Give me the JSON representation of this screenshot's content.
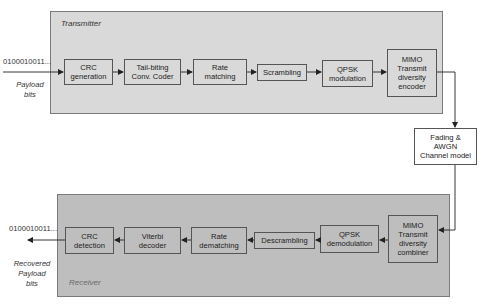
{
  "transmitter": {
    "label": "Transmitter",
    "blocks": [
      {
        "id": "crc_gen",
        "label": "CRC\ngeneration"
      },
      {
        "id": "conv_coder",
        "label": "Tail-biting\nConv. Coder"
      },
      {
        "id": "rate_match",
        "label": "Rate\nmatching"
      },
      {
        "id": "scrambling",
        "label": "Scrambling"
      },
      {
        "id": "qpsk_mod",
        "label": "QPSK\nmodulation"
      },
      {
        "id": "mimo_enc",
        "label": "MIMO\nTransmit\ndiversity\nencoder"
      }
    ],
    "input_bits": "0100010011...",
    "input_caption": "Payload\nbits"
  },
  "channel": {
    "label": "Fading &\nAWGN\nChannel model"
  },
  "receiver": {
    "label": "Receiver",
    "blocks": [
      {
        "id": "crc_det",
        "label": "CRC\ndetection"
      },
      {
        "id": "viterbi",
        "label": "Viterbi\ndecoder"
      },
      {
        "id": "rate_dematch",
        "label": "Rate\ndematching"
      },
      {
        "id": "descrambling",
        "label": "Descrambling"
      },
      {
        "id": "qpsk_demod",
        "label": "QPSK\ndemodulation"
      },
      {
        "id": "mimo_comb",
        "label": "MIMO\nTransmit\ndiversity\ncombiner"
      }
    ],
    "output_bits": "0100010011...",
    "output_caption": "Recovered\nPayload\nbits"
  },
  "colors": {
    "transmitter_panel": "#d9d9d9",
    "receiver_panel": "#bebebe",
    "border": "#555555",
    "wire": "#222222"
  }
}
